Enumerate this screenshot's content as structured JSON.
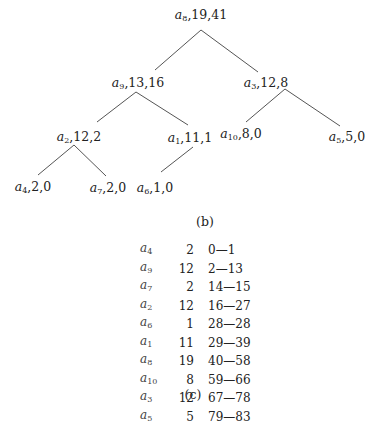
{
  "figure_b": {
    "caption": "(b)",
    "nodes": [
      {
        "id": "a8",
        "sym": "a",
        "sub": "8",
        "text": ",19,41",
        "x": 201,
        "y": 8
      },
      {
        "id": "a9",
        "sym": "a",
        "sub": "9",
        "text": ",13,16",
        "x": 138,
        "y": 76
      },
      {
        "id": "a3",
        "sym": "a",
        "sub": "3",
        "text": ",12,8",
        "x": 266,
        "y": 76
      },
      {
        "id": "a2",
        "sym": "a",
        "sub": "2",
        "text": ",12,2",
        "x": 79,
        "y": 130
      },
      {
        "id": "a1",
        "sym": "a",
        "sub": "1",
        "text": ",11,1",
        "x": 190,
        "y": 131
      },
      {
        "id": "a10",
        "sym": "a",
        "sub": "10",
        "text": ",8,0",
        "x": 241,
        "y": 127
      },
      {
        "id": "a5",
        "sym": "a",
        "sub": "5",
        "text": ",5,0",
        "x": 347,
        "y": 130
      },
      {
        "id": "a4",
        "sym": "a",
        "sub": "4",
        "text": ",2,0",
        "x": 33,
        "y": 180
      },
      {
        "id": "a7",
        "sym": "a",
        "sub": "7",
        "text": ",2,0",
        "x": 108,
        "y": 181
      },
      {
        "id": "a6",
        "sym": "a",
        "sub": "6",
        "text": ",1,0",
        "x": 155,
        "y": 181
      }
    ],
    "edges": [
      [
        201,
        30,
        155,
        70
      ],
      [
        201,
        30,
        258,
        72
      ],
      [
        136,
        92,
        97,
        122
      ],
      [
        136,
        92,
        188,
        125
      ],
      [
        285,
        89,
        246,
        122
      ],
      [
        285,
        89,
        340,
        126
      ],
      [
        74,
        145,
        38,
        175
      ],
      [
        74,
        145,
        106,
        176
      ],
      [
        193,
        147,
        161,
        172
      ]
    ]
  },
  "figure_c": {
    "caption": "(c)",
    "rows": [
      {
        "sym": "a",
        "sub": "4",
        "count": "2",
        "range": "0—1"
      },
      {
        "sym": "a",
        "sub": "9",
        "count": "12",
        "range": "2—13"
      },
      {
        "sym": "a",
        "sub": "7",
        "count": "2",
        "range": "14—15"
      },
      {
        "sym": "a",
        "sub": "2",
        "count": "12",
        "range": "16—27"
      },
      {
        "sym": "a",
        "sub": "6",
        "count": "1",
        "range": "28—28"
      },
      {
        "sym": "a",
        "sub": "1",
        "count": "11",
        "range": "29—39"
      },
      {
        "sym": "a",
        "sub": "8",
        "count": "19",
        "range": "40—58"
      },
      {
        "sym": "a",
        "sub": "10",
        "count": "8",
        "range": "59—66"
      },
      {
        "sym": "a",
        "sub": "3",
        "count": "12",
        "range": "67—78"
      },
      {
        "sym": "a",
        "sub": "5",
        "count": "5",
        "range": "79—83"
      }
    ]
  }
}
